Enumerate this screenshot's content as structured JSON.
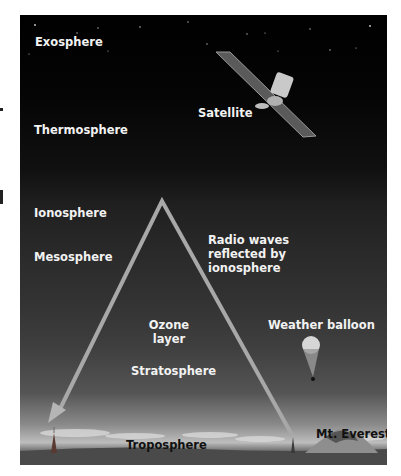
{
  "figure": {
    "layers": [
      {
        "id": "exosphere",
        "label": "Exosphere"
      },
      {
        "id": "thermosphere",
        "label": "Thermosphere"
      },
      {
        "id": "ionosphere",
        "label": "Ionosphere"
      },
      {
        "id": "mesosphere",
        "label": "Mesosphere"
      },
      {
        "id": "stratosphere",
        "label": "Stratosphere"
      },
      {
        "id": "troposphere",
        "label": "Troposphere"
      }
    ],
    "objects": {
      "satellite": "Satellite",
      "radio_waves": "Radio waves reflected by ionosphere",
      "radio_waves_lines": [
        "Radio waves",
        "reflected by",
        "ionosphere"
      ],
      "ozone_lines": [
        "Ozone",
        "layer"
      ],
      "weather_balloon": "Weather balloon",
      "mt_everest": "Mt. Everest"
    },
    "icons": [
      "satellite-icon",
      "radio-wave-arrow-icon",
      "weather-balloon-icon",
      "radio-tower-icon",
      "mountain-icon"
    ],
    "colors": {
      "sky_top": "#000000",
      "sky_mid": "#2a2a2a",
      "horizon": "#bdbdbd",
      "arrow": "#a0a0a0",
      "label_light": "#f2f2f2",
      "label_dark": "#111111"
    }
  }
}
